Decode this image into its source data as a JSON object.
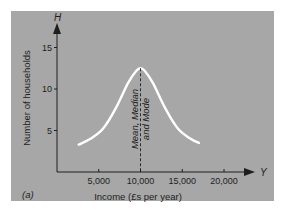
{
  "chart_data": {
    "type": "line",
    "title": "",
    "panel_label": "(a)",
    "xlabel": "Income (£s per year)",
    "ylabel": "Number of households",
    "x_axis_letter": "Y",
    "y_axis_letter": "H",
    "x_ticks": [
      5000,
      10000,
      15000,
      20000
    ],
    "x_tick_labels": [
      "5,000",
      "10,000",
      "15,000",
      "20,000"
    ],
    "y_ticks": [
      5,
      10,
      15
    ],
    "y_tick_labels": [
      "5",
      "10",
      "15"
    ],
    "xlim": [
      0,
      25000
    ],
    "ylim": [
      0,
      17
    ],
    "grid": false,
    "legend": null,
    "series": [
      {
        "name": "Income distribution (symmetric)",
        "color": "#ffffff",
        "x": [
          2600,
          4000,
          5500,
          7000,
          8500,
          9500,
          10000,
          10500,
          11500,
          13000,
          14500,
          16000,
          17000
        ],
        "values": [
          3.3,
          4.0,
          5.2,
          7.6,
          10.7,
          12.2,
          12.5,
          12.2,
          10.7,
          7.6,
          5.2,
          4.0,
          3.5
        ]
      }
    ],
    "annotations": [
      {
        "type": "vertical-dashed-line",
        "x": 10000,
        "text_lines": [
          "Mean, Median",
          "and Mode"
        ]
      }
    ],
    "colors": {
      "panel_background": "#a6a7a6",
      "axis": "#1e1e1e",
      "curve": "#ffffff"
    }
  }
}
